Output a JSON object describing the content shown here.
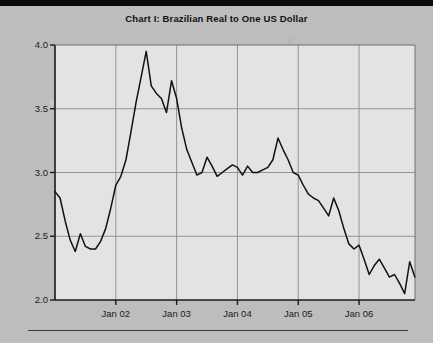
{
  "page": {
    "title": "Chart I: Brazilian Real to One US Dollar",
    "background_color": "#bdbdbd",
    "plot_background_color": "#e3e3e3",
    "line_color": "#111111",
    "grid_color": "#8a8a8a",
    "axis_color": "#1a1a1a"
  },
  "chart_data": {
    "type": "line",
    "title": "Chart I: Brazilian Real to One US Dollar",
    "xlabel": "",
    "ylabel": "",
    "grid": true,
    "legend": false,
    "xlim": [
      2001.0,
      2006.92
    ],
    "ylim": [
      2.0,
      4.0
    ],
    "ytick_labels": [
      "2.0",
      "2.5",
      "3.0",
      "3.5",
      "4.0"
    ],
    "ytick_values": [
      2.0,
      2.5,
      3.0,
      3.5,
      4.0
    ],
    "xtick_labels": [
      "Jan 02",
      "Jan 03",
      "Jan 04",
      "Jan 05",
      "Jan 06"
    ],
    "xtick_values": [
      2002.0,
      2003.0,
      2004.0,
      2005.0,
      2006.0
    ],
    "series": [
      {
        "name": "Brazilian Real per US Dollar",
        "x": [
          2001.0,
          2001.083,
          2001.167,
          2001.25,
          2001.333,
          2001.417,
          2001.5,
          2001.583,
          2001.667,
          2001.75,
          2001.833,
          2001.917,
          2002.0,
          2002.083,
          2002.167,
          2002.25,
          2002.333,
          2002.417,
          2002.5,
          2002.583,
          2002.667,
          2002.75,
          2002.833,
          2002.917,
          2003.0,
          2003.083,
          2003.167,
          2003.25,
          2003.333,
          2003.417,
          2003.5,
          2003.583,
          2003.667,
          2003.75,
          2003.833,
          2003.917,
          2004.0,
          2004.083,
          2004.167,
          2004.25,
          2004.333,
          2004.417,
          2004.5,
          2004.583,
          2004.667,
          2004.75,
          2004.833,
          2004.917,
          2005.0,
          2005.083,
          2005.167,
          2005.25,
          2005.333,
          2005.417,
          2005.5,
          2005.583,
          2005.667,
          2005.75,
          2005.833,
          2005.917,
          2006.0,
          2006.083,
          2006.167,
          2006.25,
          2006.333,
          2006.417,
          2006.5,
          2006.583,
          2006.667,
          2006.75,
          2006.833,
          2006.917
        ],
        "y": [
          2.85,
          2.8,
          2.62,
          2.47,
          2.38,
          2.52,
          2.42,
          2.4,
          2.4,
          2.46,
          2.56,
          2.72,
          2.9,
          2.97,
          3.1,
          3.32,
          3.55,
          3.75,
          3.95,
          3.68,
          3.62,
          3.58,
          3.47,
          3.72,
          3.58,
          3.35,
          3.18,
          3.08,
          2.98,
          3.0,
          3.12,
          3.05,
          2.97,
          3.0,
          3.03,
          3.06,
          3.04,
          2.98,
          3.05,
          3.0,
          3.0,
          3.02,
          3.04,
          3.1,
          3.27,
          3.18,
          3.1,
          3.0,
          2.98,
          2.9,
          2.83,
          2.8,
          2.78,
          2.72,
          2.66,
          2.8,
          2.7,
          2.56,
          2.44,
          2.4,
          2.43,
          2.32,
          2.2,
          2.27,
          2.32,
          2.25,
          2.18,
          2.2,
          2.13,
          2.05,
          2.3,
          2.18
        ]
      }
    ]
  },
  "axes": {
    "y_ticks": [
      {
        "label": "4.0",
        "value": 4.0
      },
      {
        "label": "3.5",
        "value": 3.5
      },
      {
        "label": "3.0",
        "value": 3.0
      },
      {
        "label": "2.5",
        "value": 2.5
      },
      {
        "label": "2.0",
        "value": 2.0
      }
    ],
    "x_ticks": [
      {
        "label": "Jan 02",
        "value": 2002.0
      },
      {
        "label": "Jan 03",
        "value": 2003.0
      },
      {
        "label": "Jan 04",
        "value": 2004.0
      },
      {
        "label": "Jan 05",
        "value": 2005.0
      },
      {
        "label": "Jan 06",
        "value": 2006.0
      }
    ]
  }
}
